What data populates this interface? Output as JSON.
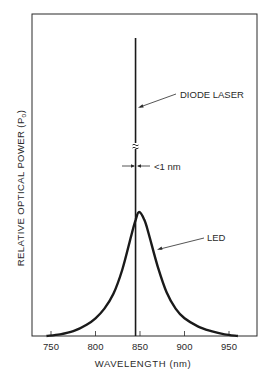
{
  "chart_data": {
    "type": "line",
    "title": "",
    "xlabel": "WAVELENGTH (nm)",
    "ylabel": "RELATIVE OPTICAL POWER (P",
    "ylabel_subscript": "o",
    "ylabel_close": ")",
    "xlim": [
      740,
      965
    ],
    "ylim": [
      0,
      1
    ],
    "grid": false,
    "legend": "none",
    "x_ticks": [
      750,
      800,
      850,
      900,
      950
    ],
    "x_tick_labels": [
      "750",
      "800",
      "850",
      "900",
      "950"
    ],
    "series": [
      {
        "name": "DIODE LASER",
        "kind": "spectral line",
        "center_nm": 845,
        "linewidth_nm": "<1",
        "relative_height": 1.0,
        "axis_break": true
      },
      {
        "name": "LED",
        "kind": "broad spectrum",
        "x": [
          745,
          760,
          775,
          790,
          800,
          810,
          820,
          830,
          840,
          845,
          849,
          855,
          860,
          870,
          880,
          890,
          900,
          915,
          930,
          945,
          960
        ],
        "y": [
          0.0,
          0.01,
          0.03,
          0.07,
          0.11,
          0.17,
          0.26,
          0.41,
          0.62,
          0.72,
          0.77,
          0.72,
          0.63,
          0.43,
          0.27,
          0.17,
          0.11,
          0.06,
          0.03,
          0.01,
          0.0
        ],
        "peak_nm": 849
      }
    ],
    "annotations": [
      {
        "text": "DIODE LASER",
        "points_to": "laser line"
      },
      {
        "text": "LED",
        "points_to": "LED curve"
      },
      {
        "text": "<1 nm",
        "points_to": "laser linewidth"
      },
      {
        "text": "≈",
        "meaning": "axis break on laser line"
      }
    ]
  }
}
